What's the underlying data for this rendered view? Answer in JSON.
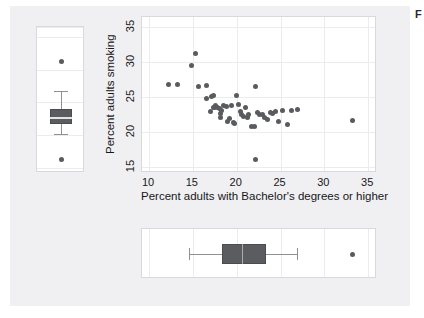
{
  "figure": {
    "background_color": "#f0f0f2",
    "panel_color": "#ffffff",
    "point_color": "#595b5f",
    "box_fill_color": "#5a5c60",
    "grid_color": "#ececed",
    "corner_glyph": "F"
  },
  "chart_data": {
    "type": "scatter",
    "title": "",
    "xlabel": "Percent adults with Bachelor's degrees or higher",
    "ylabel": "Percent adults smoking",
    "xlim": [
      9.2,
      36.0
    ],
    "ylim": [
      14.2,
      36.5
    ],
    "xticks": [
      10,
      15,
      20,
      25,
      30,
      35
    ],
    "yticks": [
      15,
      20,
      25,
      30,
      35
    ],
    "grid": true,
    "legend": "none",
    "n_points": 51,
    "x": [
      12.2,
      13.3,
      14.9,
      15.3,
      15.7,
      16.5,
      16.6,
      17.0,
      17.1,
      17.3,
      17.4,
      17.5,
      17.6,
      17.8,
      18.0,
      18.1,
      18.2,
      18.3,
      18.5,
      18.8,
      19.0,
      19.2,
      19.4,
      19.6,
      19.8,
      20.0,
      20.2,
      20.4,
      20.6,
      20.8,
      21.0,
      21.2,
      21.4,
      21.7,
      22.0,
      22.2,
      22.4,
      22.6,
      22.9,
      23.2,
      23.5,
      23.8,
      24.1,
      24.4,
      24.8,
      25.2,
      25.8,
      26.3,
      26.9,
      22.1,
      33.2
    ],
    "y": [
      26.8,
      26.8,
      29.6,
      31.3,
      26.6,
      24.9,
      26.7,
      23.0,
      25.1,
      25.3,
      23.6,
      23.5,
      23.8,
      23.5,
      23.4,
      22.7,
      22.2,
      23.2,
      23.9,
      23.7,
      21.6,
      22.0,
      23.8,
      21.4,
      21.3,
      25.3,
      24.0,
      23.0,
      22.6,
      22.3,
      23.5,
      22.2,
      22.5,
      20.9,
      20.8,
      26.6,
      22.8,
      22.6,
      22.5,
      22.2,
      21.8,
      22.9,
      22.7,
      23.0,
      21.5,
      23.1,
      21.2,
      23.2,
      23.3,
      16.2,
      21.7
    ],
    "marginal_boxplots": {
      "x_axis": {
        "orientation": "horizontal",
        "whisker_low": 14.6,
        "q1": 18.3,
        "median": 20.6,
        "q3": 23.3,
        "whisker_high": 26.9,
        "outliers": [
          33.2
        ]
      },
      "y_axis": {
        "orientation": "vertical",
        "whisker_low": 20.2,
        "q1": 21.7,
        "median": 22.7,
        "q3": 23.9,
        "whisker_high": 26.8,
        "outliers": [
          31.3,
          16.2
        ]
      }
    }
  },
  "axis": {
    "xticks_labels": [
      "10",
      "15",
      "20",
      "25",
      "30",
      "35"
    ],
    "yticks_labels": [
      "15",
      "20",
      "25",
      "30",
      "35"
    ]
  }
}
